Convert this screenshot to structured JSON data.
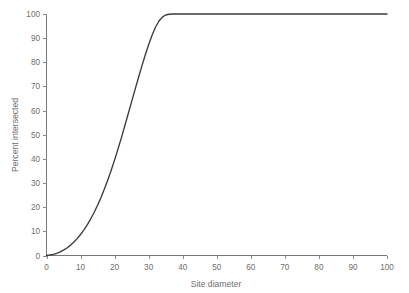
{
  "chart_data": {
    "type": "line",
    "title": "",
    "xlabel": "Site diameter",
    "ylabel": "Percent intersected",
    "xlim": [
      0,
      100
    ],
    "ylim": [
      0,
      100
    ],
    "xticks": [
      0,
      10,
      20,
      30,
      40,
      50,
      60,
      70,
      80,
      90,
      100
    ],
    "yticks": [
      0,
      10,
      20,
      30,
      40,
      50,
      60,
      70,
      80,
      90,
      100
    ],
    "xtick_labels": [
      "0",
      "10",
      "20",
      "30",
      "40",
      "50",
      "60",
      "70",
      "80",
      "90",
      "100"
    ],
    "ytick_labels": [
      "0",
      "10",
      "20",
      "30",
      "40",
      "50",
      "60",
      "70",
      "80",
      "90",
      "100"
    ],
    "grid": false,
    "legend": null,
    "line_color": "#3b3b3b",
    "axis_color": "#6e6e6e",
    "background_color": "#ffffff",
    "series": [
      {
        "name": "Percent intersected vs site diameter",
        "x": [
          0,
          1,
          2,
          3,
          4,
          5,
          6,
          7,
          8,
          9,
          10,
          11,
          12,
          13,
          14,
          15,
          16,
          17,
          18,
          19,
          20,
          21,
          22,
          23,
          24,
          25,
          26,
          27,
          28,
          29,
          30,
          31,
          32,
          33,
          34,
          35,
          36,
          37,
          38,
          40,
          45,
          50,
          55,
          60,
          65,
          70,
          75,
          80,
          85,
          90,
          95,
          100
        ],
        "y": [
          0.0,
          0.2,
          0.5,
          0.9,
          1.5,
          2.2,
          3.1,
          4.2,
          5.5,
          7.0,
          8.7,
          10.6,
          12.8,
          15.2,
          17.9,
          20.8,
          24.0,
          27.5,
          31.3,
          35.3,
          39.6,
          44.1,
          48.8,
          53.7,
          58.7,
          63.7,
          68.7,
          73.6,
          78.4,
          83.0,
          87.3,
          91.2,
          94.5,
          97.0,
          98.7,
          99.6,
          99.9,
          100.0,
          100.0,
          100.0,
          100.0,
          100.0,
          100.0,
          100.0,
          100.0,
          100.0,
          100.0,
          100.0,
          100.0,
          100.0,
          100.0,
          100.0
        ]
      }
    ]
  },
  "figure": {
    "xlabel": "Site diameter",
    "ylabel": "Percent intersected"
  }
}
